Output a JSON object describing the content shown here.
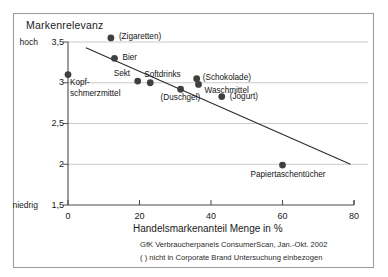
{
  "chart_data": {
    "type": "scatter",
    "title": "Markenrelevanz",
    "xlabel": "Handelsmarkenanteil Menge in %",
    "ylabel": "Markenrelevanz",
    "xlim": [
      0,
      80
    ],
    "ylim": [
      1.5,
      3.5
    ],
    "xticks": [
      0,
      20,
      40,
      60,
      80
    ],
    "xticklabels": [
      "0",
      "20",
      "40",
      "60",
      "80"
    ],
    "yticks": [
      1.5,
      2,
      2.5,
      3,
      3.5
    ],
    "yticklabels": [
      "1,5",
      "2",
      "2,5",
      "3",
      "3,5"
    ],
    "y_axis_end_labels": {
      "low": "niedrig",
      "high": "hoch"
    },
    "grid": true,
    "legend": "none",
    "points": [
      {
        "label": "Kopf-\nschmerzmittel",
        "label_lines": [
          "Kopf-",
          "schmerzmittel"
        ],
        "x": 0.0,
        "y": 3.1
      },
      {
        "label": "(Zigaretten)",
        "label_lines": [
          "(Zigaretten)"
        ],
        "x": 12.0,
        "y": 3.55
      },
      {
        "label": "Bier",
        "label_lines": [
          "Bier"
        ],
        "x": 13.0,
        "y": 3.3
      },
      {
        "label": "Sekt",
        "label_lines": [
          "Sekt"
        ],
        "x": 19.5,
        "y": 3.02
      },
      {
        "label": "Softdrinks",
        "label_lines": [
          "Softdrinks"
        ],
        "x": 23.0,
        "y": 3.0
      },
      {
        "label": "(Duschgel)",
        "label_lines": [
          "(Duschgel)"
        ],
        "x": 31.5,
        "y": 2.92
      },
      {
        "label": "(Schokolade)",
        "label_lines": [
          "(Schokolade)"
        ],
        "x": 36.0,
        "y": 3.05
      },
      {
        "label": "Waschmittel",
        "label_lines": [
          "Waschmittel"
        ],
        "x": 36.5,
        "y": 2.98
      },
      {
        "label": "(Jogurt)",
        "label_lines": [
          "(Jogurt)"
        ],
        "x": 43.0,
        "y": 2.83
      },
      {
        "label": "Papiertaschentücher",
        "label_lines": [
          "Papiertaschentücher"
        ],
        "x": 60.0,
        "y": 1.99
      }
    ],
    "trendline": {
      "x0": 5.0,
      "y0": 3.43,
      "x1": 79.0,
      "y1": 2.0
    },
    "annotations": [
      "GfK Verbraucherpanels ConsumerScan, Jan.-Okt. 2002",
      "( ) nicht in Corporate Brand Untersuchung einbezogen"
    ],
    "colors": {
      "marker": "#404040",
      "trendline": "#2b2b2b",
      "grid": "#bdbdbd",
      "axis": "#4a4a4a",
      "text": "#1a1a1a",
      "frame": "#9a9a9a",
      "background": "#ffffff"
    }
  }
}
